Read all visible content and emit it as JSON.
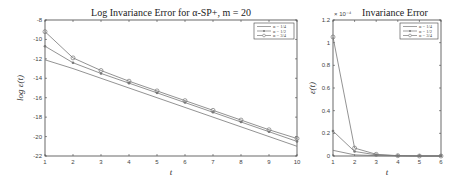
{
  "chart_data": [
    {
      "type": "line",
      "title": "Log Invariance Error for α-SP+, m = 20",
      "xlabel": "t",
      "ylabel": "log ε(t)",
      "xlim": [
        1,
        10
      ],
      "ylim": [
        -22,
        -8
      ],
      "xticks": [
        1,
        2,
        3,
        4,
        5,
        6,
        7,
        8,
        9,
        10
      ],
      "yticks": [
        -8,
        -10,
        -12,
        -14,
        -16,
        -18,
        -20,
        -22
      ],
      "grid": false,
      "legend_position": "upper right",
      "x": [
        1,
        2,
        3,
        4,
        5,
        6,
        7,
        8,
        9,
        10
      ],
      "series": [
        {
          "name": "α = 1/4",
          "marker": "none",
          "values": [
            -12.1,
            -13.0,
            -14.0,
            -15.0,
            -16.0,
            -17.0,
            -18.0,
            -19.0,
            -20.0,
            -21.0
          ]
        },
        {
          "name": "α = 1/2",
          "marker": "star",
          "values": [
            -10.7,
            -12.4,
            -13.5,
            -14.5,
            -15.5,
            -16.5,
            -17.5,
            -18.5,
            -19.5,
            -20.5
          ]
        },
        {
          "name": "α = 3/4",
          "marker": "circle",
          "values": [
            -9.2,
            -11.9,
            -13.2,
            -14.3,
            -15.3,
            -16.3,
            -17.3,
            -18.3,
            -19.3,
            -20.2
          ]
        }
      ]
    },
    {
      "type": "line",
      "title": "Invariance Error",
      "y_exponent": "× 10⁻⁴",
      "xlabel": "t",
      "ylabel": "ε(t)",
      "xlim": [
        1,
        6
      ],
      "ylim": [
        0,
        1.2
      ],
      "xticks": [
        1,
        2,
        3,
        4,
        5,
        6
      ],
      "yticks": [
        0,
        0.2,
        0.4,
        0.6,
        0.8,
        1,
        1.2
      ],
      "grid": false,
      "legend_position": "upper right",
      "x": [
        1,
        2,
        3,
        4,
        5,
        6
      ],
      "series": [
        {
          "name": "α = 1/4",
          "marker": "none",
          "values": [
            0.05,
            0.01,
            0.003,
            0.001,
            0.0,
            0.0
          ]
        },
        {
          "name": "α = 1/2",
          "marker": "star",
          "values": [
            0.22,
            0.04,
            0.01,
            0.002,
            0.0,
            0.0
          ]
        },
        {
          "name": "α = 3/4",
          "marker": "circle",
          "values": [
            1.05,
            0.07,
            0.015,
            0.003,
            0.0,
            0.0
          ]
        }
      ]
    }
  ],
  "colors": {
    "line": "#777777",
    "axis": "#444444",
    "text": "#222222"
  }
}
